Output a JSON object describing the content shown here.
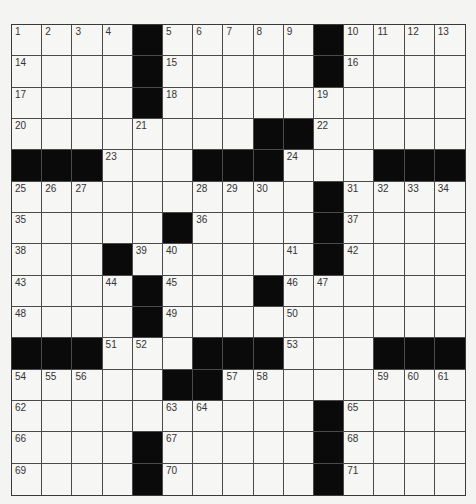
{
  "puzzle": {
    "size": {
      "rows": 15,
      "cols": 15
    },
    "colors": {
      "paper": "#f4f4f2",
      "block": "#0a0a0a",
      "grid_line": "#4a4a4a",
      "number": "#333333"
    },
    "grid": [
      [
        "1",
        "2",
        "3",
        "4",
        "#",
        "5",
        "6",
        "7",
        "8",
        "9",
        "#",
        "10",
        "11",
        "12",
        "13"
      ],
      [
        "14",
        "",
        "",
        "",
        "#",
        "15",
        "",
        "",
        "",
        "",
        "#",
        "16",
        "",
        "",
        ""
      ],
      [
        "17",
        "",
        "",
        "",
        "#",
        "18",
        "",
        "",
        "",
        "",
        "19",
        "",
        "",
        "",
        ""
      ],
      [
        "20",
        "",
        "",
        "",
        "21",
        "",
        "",
        "",
        "#",
        "#",
        "22",
        "",
        "",
        "",
        ""
      ],
      [
        "#",
        "#",
        "#",
        "23",
        "",
        "",
        "#",
        "#",
        "#",
        "24",
        "",
        "",
        "#",
        "#",
        "#"
      ],
      [
        "25",
        "26",
        "27",
        "",
        "",
        "",
        "28",
        "29",
        "30",
        "",
        "#",
        "31",
        "32",
        "33",
        "34"
      ],
      [
        "35",
        "",
        "",
        "",
        "",
        "#",
        "36",
        "",
        "",
        "",
        "#",
        "37",
        "",
        "",
        ""
      ],
      [
        "38",
        "",
        "",
        "#",
        "39",
        "40",
        "",
        "",
        "",
        "41",
        "#",
        "42",
        "",
        "",
        ""
      ],
      [
        "43",
        "",
        "",
        "44",
        "#",
        "45",
        "",
        "",
        "#",
        "46",
        "47",
        "",
        "",
        "",
        ""
      ],
      [
        "48",
        "",
        "",
        "",
        "#",
        "49",
        "",
        "",
        "",
        "50",
        "",
        "",
        "",
        "",
        ""
      ],
      [
        "#",
        "#",
        "#",
        "51",
        "52",
        "",
        "#",
        "#",
        "#",
        "53",
        "",
        "",
        "#",
        "#",
        "#"
      ],
      [
        "54",
        "55",
        "56",
        "",
        "",
        "#",
        "#",
        "57",
        "58",
        "",
        "",
        "",
        "59",
        "60",
        "61"
      ],
      [
        "62",
        "",
        "",
        "",
        "",
        "63",
        "64",
        "",
        "",
        "",
        "#",
        "65",
        "",
        "",
        ""
      ],
      [
        "66",
        "",
        "",
        "",
        "#",
        "67",
        "",
        "",
        "",
        "",
        "#",
        "68",
        "",
        "",
        ""
      ],
      [
        "69",
        "",
        "",
        "",
        "#",
        "70",
        "",
        "",
        "",
        "",
        "#",
        "71",
        "",
        "",
        ""
      ]
    ]
  }
}
